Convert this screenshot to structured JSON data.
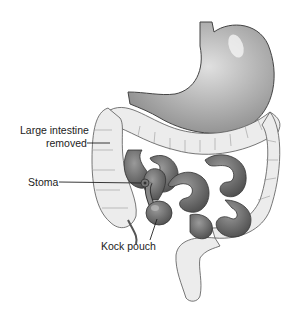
{
  "diagram": {
    "labels": {
      "large_intestine_line1": "Large intestine",
      "large_intestine_line2": "removed",
      "stoma": "Stoma",
      "kock_pouch": "Kock pouch"
    },
    "colors": {
      "stomach": "#bdbdbd",
      "small_intestine": "#7a7a7a",
      "large_intestine_removed": "#ececec",
      "outline": "#444444",
      "label_text": "#222222"
    }
  }
}
